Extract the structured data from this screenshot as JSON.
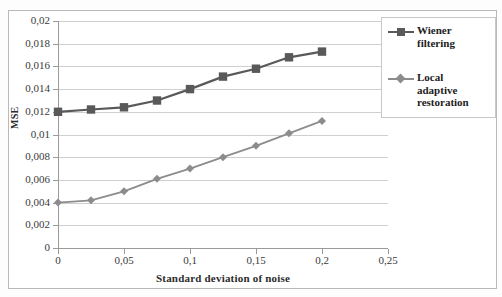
{
  "chart_data": {
    "type": "line",
    "title": "",
    "xlabel": "Standard deviation of noise",
    "ylabel": "MSE",
    "x": [
      0,
      0.025,
      0.05,
      0.075,
      0.1,
      0.125,
      0.15,
      0.175,
      0.2
    ],
    "xlim": [
      0,
      0.25
    ],
    "ylim": [
      0,
      0.02
    ],
    "grid": true,
    "legend_position": "right",
    "xtick_labels": [
      "0",
      "0,05",
      "0,1",
      "0,15",
      "0,2",
      "0,25"
    ],
    "xtick_values": [
      0,
      0.05,
      0.1,
      0.15,
      0.2,
      0.25
    ],
    "ytick_labels": [
      "0,02",
      "0,018",
      "0,016",
      "0,014",
      "0,012",
      "0,01",
      "0,008",
      "0,006",
      "0,004",
      "0,002",
      "0"
    ],
    "ytick_values": [
      0.02,
      0.018,
      0.016,
      0.014,
      0.012,
      0.01,
      0.008,
      0.006,
      0.004,
      0.002,
      0
    ],
    "series": [
      {
        "name": "Wiener filtering",
        "legend_label": "Wiener filtering",
        "color": "#595959",
        "marker": "square",
        "values": [
          0.012,
          0.0122,
          0.0124,
          0.013,
          0.014,
          0.0151,
          0.0158,
          0.0168,
          0.0173
        ]
      },
      {
        "name": "Local adaptive restoration",
        "legend_label": "Local adaptive restoration",
        "color": "#8c8c8c",
        "marker": "diamond",
        "values": [
          0.004,
          0.0042,
          0.005,
          0.0061,
          0.007,
          0.008,
          0.009,
          0.0101,
          0.0112
        ]
      }
    ]
  },
  "legend": {
    "entries": [
      {
        "label_line1": "Wiener",
        "label_line2": "filtering"
      },
      {
        "label_line1": "Local",
        "label_line2": "adaptive",
        "label_line3": "restoration"
      }
    ]
  },
  "axes": {
    "x_title": "Standard deviation of noise",
    "y_title": "MSE"
  }
}
